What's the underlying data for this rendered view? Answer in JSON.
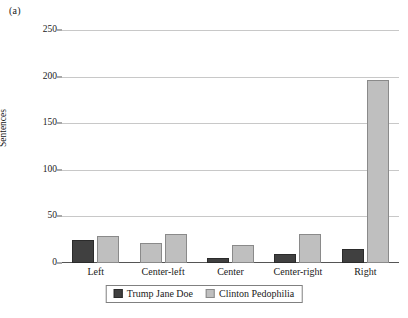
{
  "panel_label": "(a)",
  "chart_data": {
    "type": "bar",
    "title": "",
    "xlabel": "",
    "ylabel": "Sentences",
    "ylim": [
      0,
      250
    ],
    "yticks": [
      0,
      50,
      100,
      150,
      200,
      250
    ],
    "ytick_labels": [
      "0",
      "50",
      "100",
      "150",
      "200",
      "250"
    ],
    "grid": true,
    "legend_position": "bottom-center",
    "categories": [
      "Left",
      "Center-left",
      "Center",
      "Center-right",
      "Right"
    ],
    "series": [
      {
        "name": "Trump Jane Doe",
        "color": "#404040",
        "values": [
          25,
          21,
          5,
          10,
          15
        ]
      },
      {
        "name": "Clinton Pedophilia",
        "color": "#bfbfbf",
        "values": [
          29,
          31,
          19,
          31,
          196
        ]
      }
    ]
  },
  "legend": {
    "items": [
      {
        "label": "Trump Jane Doe"
      },
      {
        "label": "Clinton Pedophilia"
      }
    ]
  },
  "colors": {
    "series_dark": "#404040",
    "series_light": "#bfbfbf",
    "gridline": "#c8c8c8",
    "axis": "#555555"
  }
}
